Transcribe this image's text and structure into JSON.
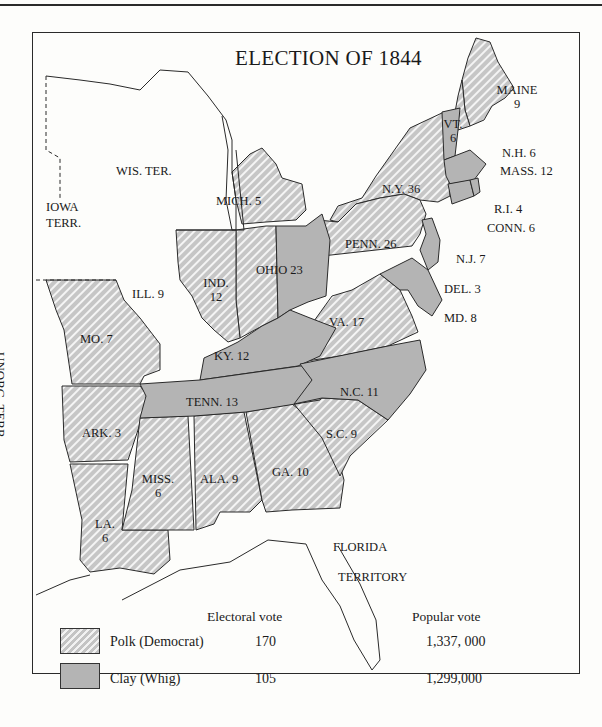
{
  "map": {
    "title": "ELECTION OF 1844",
    "colors": {
      "polk_fill": "#c4c4c4",
      "polk_stripe": "#f2f2f2",
      "clay_fill": "#b4b4b4",
      "border": "#2a2a2a",
      "background": "#fdfdfb"
    },
    "states": [
      {
        "id": "maine",
        "label": "MAINE",
        "votes": "9",
        "winner": "Polk"
      },
      {
        "id": "vermont",
        "label": "VT.",
        "votes": "6",
        "winner": "Clay"
      },
      {
        "id": "new-hampshire",
        "label": "N.H. 6",
        "winner": "Polk"
      },
      {
        "id": "massachusetts",
        "label": "MASS. 12",
        "winner": "Clay"
      },
      {
        "id": "rhode-island",
        "label": "R.I. 4",
        "winner": "Clay"
      },
      {
        "id": "connecticut",
        "label": "CONN. 6",
        "winner": "Clay"
      },
      {
        "id": "new-york",
        "label": "N.Y. 36",
        "winner": "Polk"
      },
      {
        "id": "pennsylvania",
        "label": "PENN. 26",
        "winner": "Polk"
      },
      {
        "id": "new-jersey",
        "label": "N.J. 7",
        "winner": "Clay"
      },
      {
        "id": "delaware",
        "label": "DEL. 3",
        "winner": "Clay"
      },
      {
        "id": "maryland",
        "label": "MD. 8",
        "winner": "Clay"
      },
      {
        "id": "virginia",
        "label": "VA. 17",
        "winner": "Polk"
      },
      {
        "id": "north-carolina",
        "label": "N.C. 11",
        "winner": "Clay"
      },
      {
        "id": "south-carolina",
        "label": "S.C. 9",
        "winner": "Polk"
      },
      {
        "id": "georgia",
        "label": "GA. 10",
        "winner": "Polk"
      },
      {
        "id": "alabama",
        "label": "ALA. 9",
        "winner": "Polk"
      },
      {
        "id": "mississippi",
        "label": "MISS.",
        "votes": "6",
        "winner": "Polk"
      },
      {
        "id": "louisiana",
        "label": "LA.",
        "votes": "6",
        "winner": "Polk"
      },
      {
        "id": "arkansas",
        "label": "ARK. 3",
        "winner": "Polk"
      },
      {
        "id": "tennessee",
        "label": "TENN. 13",
        "winner": "Clay"
      },
      {
        "id": "kentucky",
        "label": "KY. 12",
        "winner": "Clay"
      },
      {
        "id": "ohio",
        "label": "OHIO 23",
        "winner": "Clay"
      },
      {
        "id": "indiana",
        "label": "IND.",
        "votes": "12",
        "winner": "Polk"
      },
      {
        "id": "illinois",
        "label": "ILL. 9",
        "winner": "Polk"
      },
      {
        "id": "missouri",
        "label": "MO. 7",
        "winner": "Polk"
      },
      {
        "id": "michigan",
        "label": "MICH. 5",
        "winner": "Polk"
      }
    ],
    "territories": {
      "wisconsin": "WIS. TER.",
      "iowa_line1": "IOWA",
      "iowa_line2": "TERR.",
      "unorganized": "UNORG. TERR.",
      "florida_line1": "FLORIDA",
      "florida_line2": "TERRITORY"
    }
  },
  "legend": {
    "electoral_header": "Electoral vote",
    "popular_header": "Popular vote",
    "rows": [
      {
        "candidate": "Polk (Democrat)",
        "electoral": "170",
        "popular": "1,337, 000",
        "pattern": "hatched"
      },
      {
        "candidate": "Clay (Whig)",
        "electoral": "105",
        "popular": "1,299,000",
        "pattern": "solid-gray"
      }
    ]
  }
}
